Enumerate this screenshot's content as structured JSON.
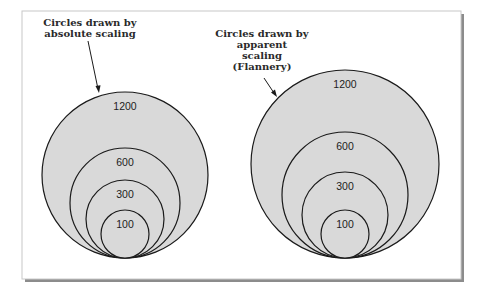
{
  "colors": {
    "fill": "#d9d9d9",
    "stroke": "#1a1a1a",
    "frame": "#c8c8c8",
    "shadow": "#8c8c8c",
    "background": "#ffffff"
  },
  "left_group": {
    "caption_lines": [
      "Circles drawn by",
      "absolute scaling"
    ],
    "circles": [
      {
        "label": "1200",
        "r": 83
      },
      {
        "label": "600",
        "r": 55
      },
      {
        "label": "300",
        "r": 39
      },
      {
        "label": "100",
        "r": 24
      }
    ]
  },
  "right_group": {
    "caption_lines": [
      "Circles drawn by",
      "apparent",
      "scaling",
      "(Flannery)"
    ],
    "circles": [
      {
        "label": "1200",
        "r": 94
      },
      {
        "label": "600",
        "r": 63
      },
      {
        "label": "300",
        "r": 43
      },
      {
        "label": "100",
        "r": 24
      }
    ]
  }
}
